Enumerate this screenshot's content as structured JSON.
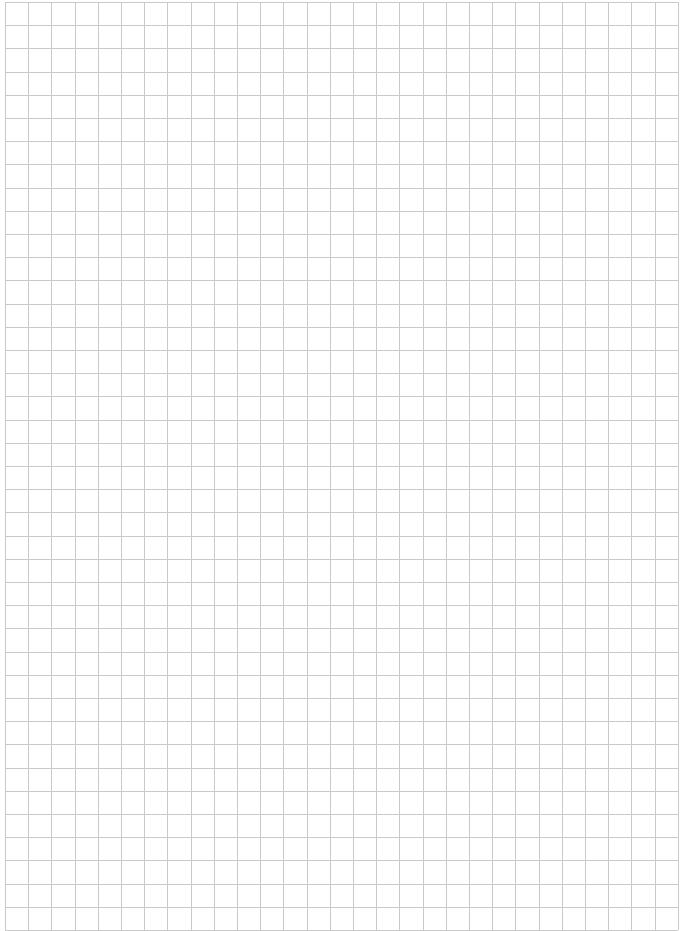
{
  "page": {
    "type": "graph-paper",
    "background_color": "#ffffff",
    "line_color": "#c9c9c9"
  },
  "grid": {
    "origin_x": 5,
    "origin_y": 2,
    "cell_size": 23.2,
    "columns": 29,
    "rows": 40
  }
}
